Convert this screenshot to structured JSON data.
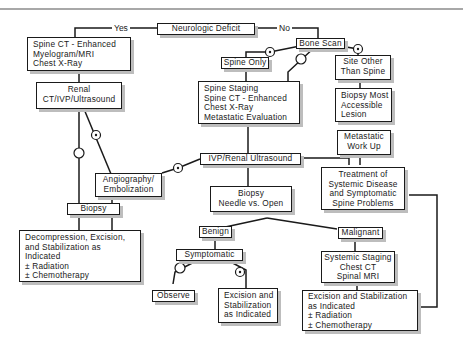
{
  "diagram": {
    "type": "flowchart",
    "title": "Neurologic Deficit",
    "branch_labels": {
      "yes": "Yes",
      "no": "No"
    },
    "nodes": {
      "neuro_deficit": [
        "Neurologic Deficit"
      ],
      "spine_ct_myelo": [
        "Spine CT - Enhanced",
        "Myelogram/MRI",
        "Chest X-Ray"
      ],
      "renal_ct": [
        "Renal",
        "CT/IVP/Ultrasound"
      ],
      "angiography": [
        "Angiography/",
        "Embolization"
      ],
      "biopsy_left": [
        "Biopsy"
      ],
      "decompression": [
        "Decompression, Excision,",
        "and Stabilization as",
        "Indicated",
        "± Radiation",
        "± Chemotherapy"
      ],
      "bone_scan": [
        "Bone Scan"
      ],
      "spine_only": [
        "Spine Only"
      ],
      "site_other": [
        "Site Other",
        "Than Spine"
      ],
      "spine_staging": [
        "Spine Staging",
        "Spine CT - Enhanced",
        "Chest X-Ray",
        "Metastatic Evaluation"
      ],
      "biopsy_accessible": [
        "Biopsy Most",
        "Accessible",
        "Lesion"
      ],
      "metastatic_workup": [
        "Metastatic",
        "Work Up"
      ],
      "ivp_renal": [
        "IVP/Renal Ultrasound"
      ],
      "treatment_systemic": [
        "Treatment of",
        "Systemic Disease",
        "and Symptomatic",
        "Spine Problems"
      ],
      "biopsy_needle": [
        "Biopsy",
        "Needle vs. Open"
      ],
      "benign": [
        "Benign"
      ],
      "malignant": [
        "Malignant"
      ],
      "symptomatic": [
        "Symptomatic"
      ],
      "observe": [
        "Observe"
      ],
      "excision_benign": [
        "Excision and",
        "Stabilization",
        "as Indicated"
      ],
      "systemic_staging": [
        "Systemic Staging",
        "Chest CT",
        "Spinal MRI"
      ],
      "excision_malignant": [
        "Excision and Stabilization",
        "as Indicated",
        "± Radiation",
        "± Chemotherapy"
      ]
    },
    "edge_markers": {
      "positive": "⊙",
      "negative": "○"
    }
  }
}
